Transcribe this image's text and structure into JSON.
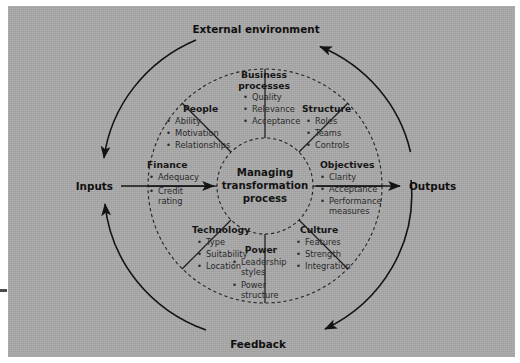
{
  "figure": {
    "title": "Managing transformation process",
    "background_color": "#a8a8a8",
    "ink_color": "#1c1c1c"
  },
  "hub": {
    "line1": "Managing",
    "line2": "transformation",
    "line3": "process"
  },
  "outer_labels": {
    "top": "External environment",
    "bottom": "Feedback",
    "left": "Inputs",
    "right": "Outputs"
  },
  "segments": [
    {
      "id": "business-processes",
      "title_lines": [
        "Business",
        "processes"
      ],
      "items": [
        "Quality",
        "Relevance",
        "Acceptance"
      ]
    },
    {
      "id": "structure",
      "title_lines": [
        "Structure"
      ],
      "items": [
        "Roles",
        "Teams",
        "Controls"
      ]
    },
    {
      "id": "objectives",
      "title_lines": [
        "Objectives"
      ],
      "items": [
        "Clarity",
        "Acceptance",
        "Performance measures"
      ]
    },
    {
      "id": "culture",
      "title_lines": [
        "Culture"
      ],
      "items": [
        "Features",
        "Strength",
        "Integration"
      ]
    },
    {
      "id": "power",
      "title_lines": [
        "Power"
      ],
      "items": [
        "Leadership styles",
        "Power structure"
      ]
    },
    {
      "id": "technology",
      "title_lines": [
        "Technology"
      ],
      "items": [
        "Type",
        "Suitability",
        "Location"
      ]
    },
    {
      "id": "finance",
      "title_lines": [
        "Finance"
      ],
      "items": [
        "Adequacy",
        "Credit rating"
      ]
    },
    {
      "id": "people",
      "title_lines": [
        "People"
      ],
      "items": [
        "Ability",
        "Motivation",
        "Relationships"
      ]
    }
  ],
  "text": {
    "business_title_1": "Business",
    "business_title_2": "processes",
    "business_i1": "Quality",
    "business_i2": "Relevance",
    "business_i3": "Acceptance",
    "structure_title": "Structure",
    "structure_i1": "Roles",
    "structure_i2": "Teams",
    "structure_i3": "Controls",
    "objectives_title": "Objectives",
    "objectives_i1": "Clarity",
    "objectives_i2": "Acceptance",
    "objectives_i3a": "Performance",
    "objectives_i3b": "measures",
    "culture_title": "Culture",
    "culture_i1": "Features",
    "culture_i2": "Strength",
    "culture_i3": "Integration",
    "power_title": "Power",
    "power_i1a": "Leadership",
    "power_i1b": "styles",
    "power_i2a": "Power",
    "power_i2b": "structure",
    "technology_title": "Technology",
    "technology_i1": "Type",
    "technology_i2": "Suitability",
    "technology_i3": "Location",
    "finance_title": "Finance",
    "finance_i1": "Adequacy",
    "finance_i2a": "Credit",
    "finance_i2b": "rating",
    "people_title": "People",
    "people_i1": "Ability",
    "people_i2": "Motivation",
    "people_i3": "Relationships",
    "bullet": "•"
  }
}
